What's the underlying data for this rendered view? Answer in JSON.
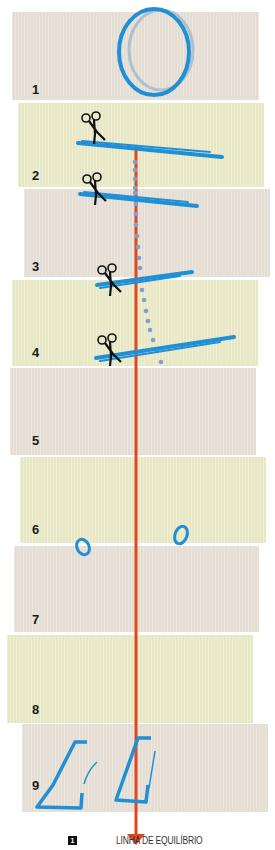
{
  "figure": {
    "steps": [
      {
        "number": "1",
        "color": "gray"
      },
      {
        "number": "2",
        "color": "yellow"
      },
      {
        "number": "3",
        "color": "gray"
      },
      {
        "number": "4",
        "color": "yellow"
      },
      {
        "number": "5",
        "color": "gray"
      },
      {
        "number": "6",
        "color": "yellow"
      },
      {
        "number": "7",
        "color": "gray"
      },
      {
        "number": "8",
        "color": "yellow"
      },
      {
        "number": "9",
        "color": "gray"
      }
    ],
    "colors": {
      "panel_gray": "#e8e1d8",
      "panel_yellow": "#ecebc9",
      "stroke_blue": "#1f8fd6",
      "dots_blue": "#7f9fd6",
      "balance_line": "#e0481b"
    }
  },
  "legend": {
    "badge": "1",
    "label": "LINHA DE EQUILÍBRIO"
  }
}
